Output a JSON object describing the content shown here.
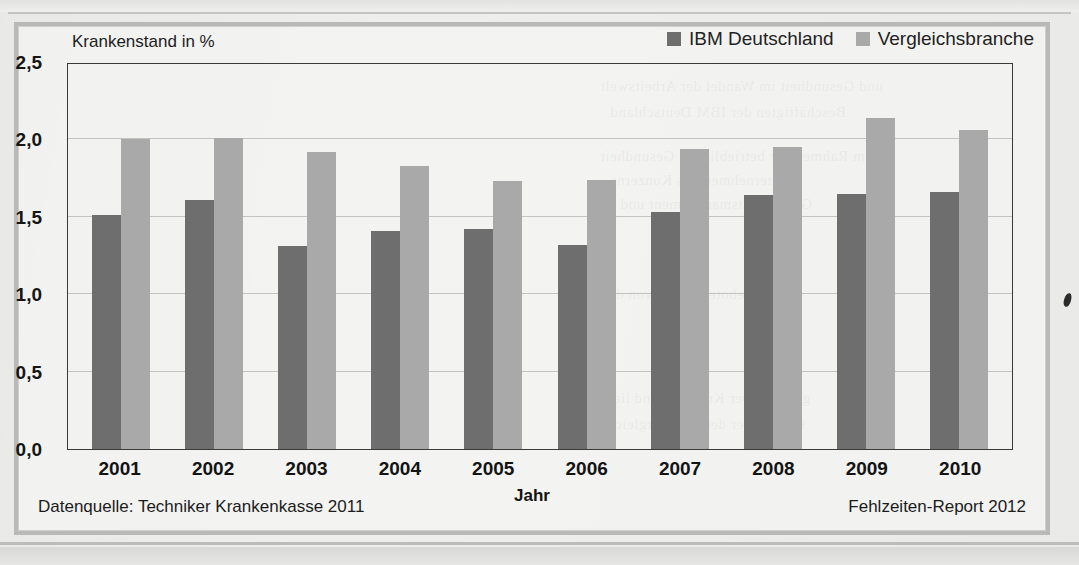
{
  "figure": {
    "ylabel": "Krankenstand in %",
    "xlabel": "Jahr",
    "source_note": "Datenquelle: Techniker Krankenkasse 2011",
    "report_note": "Fehlzeiten-Report 2012"
  },
  "legend": {
    "series1_label": "IBM Deutschland",
    "series1_color": "#6e6e6e",
    "series2_label": "Vergleichsbranche",
    "series2_color": "#a9a9a9"
  },
  "yticks": [
    "2,5",
    "2,0",
    "1,5",
    "1,0",
    "0,5",
    "0,0"
  ],
  "bleed_text": [
    "und Gesundheit im Wandel der Arbeitswelt",
    "Beschäftigten der IBM Deutschland",
    "im Rahmen der betrieblichen Gesundheit",
    "Unternehmen des Konzerns",
    "Gesundheitsmanagement und",
    "Die Angebote werden von den",
    "genutzt. Der Krankenstand liegt",
    "stabil unter dem der Vergleichs"
  ],
  "chart_data": {
    "type": "bar",
    "title": "",
    "subtitle": "",
    "xlabel": "Jahr",
    "ylabel": "Krankenstand in %",
    "ylim": [
      0.0,
      2.5
    ],
    "ytick_values": [
      2.5,
      2.0,
      1.5,
      1.0,
      0.5,
      0.0
    ],
    "grid": true,
    "legend_position": "top-right",
    "categories": [
      "2001",
      "2002",
      "2003",
      "2004",
      "2005",
      "2006",
      "2007",
      "2008",
      "2009",
      "2010"
    ],
    "series": [
      {
        "name": "IBM Deutschland",
        "color": "#6e6e6e",
        "values": [
          1.51,
          1.61,
          1.31,
          1.41,
          1.42,
          1.32,
          1.53,
          1.64,
          1.65,
          1.66
        ]
      },
      {
        "name": "Vergleichsbranche",
        "color": "#a9a9a9",
        "values": [
          2.0,
          2.01,
          1.92,
          1.83,
          1.73,
          1.74,
          1.94,
          1.95,
          2.14,
          2.06
        ]
      }
    ],
    "annotations": [
      "Datenquelle: Techniker Krankenkasse 2011",
      "Fehlzeiten-Report 2012"
    ]
  }
}
